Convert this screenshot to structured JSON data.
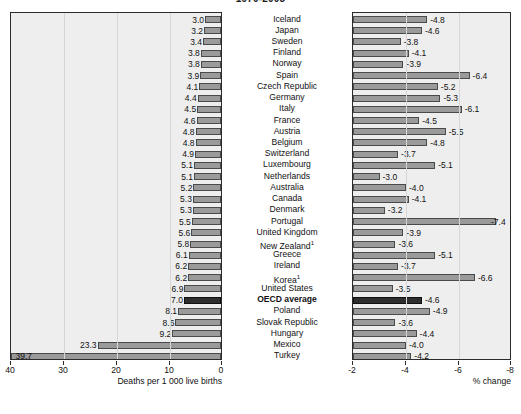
{
  "chart_data": {
    "type": "bar",
    "title": "1970-2005",
    "orientation": "horizontal",
    "panels": [
      {
        "id": "levels",
        "xlabel": "Deaths per 1 000 live births",
        "ticks": [
          40,
          30,
          20,
          10,
          0
        ],
        "xlim": [
          40,
          0
        ],
        "reversed": true,
        "grid": true
      },
      {
        "id": "change",
        "xlabel": "% change",
        "ticks": [
          -2,
          -4,
          -6,
          -8
        ],
        "xlim": [
          -2,
          -8
        ],
        "reversed": true,
        "grid": true
      }
    ],
    "categories": [
      "Iceland",
      "Japan",
      "Sweden",
      "Finland",
      "Norway",
      "Spain",
      "Czech Republic",
      "Germany",
      "Italy",
      "France",
      "Austria",
      "Belgium",
      "Switzerland",
      "Luxembourg",
      "Netherlands",
      "Australia",
      "Canada",
      "Denmark",
      "Portugal",
      "United Kingdom",
      "New Zealand¹",
      "Greece",
      "Ireland",
      "Korea¹",
      "United States",
      "OECD average",
      "Poland",
      "Slovak Republic",
      "Hungary",
      "Mexico",
      "Turkey"
    ],
    "series": [
      {
        "name": "Deaths per 1 000 live births",
        "panel": "levels",
        "values": [
          3.0,
          3.2,
          3.4,
          3.8,
          3.8,
          3.9,
          4.1,
          4.4,
          4.5,
          4.6,
          4.8,
          4.8,
          4.9,
          5.1,
          5.1,
          5.2,
          5.3,
          5.3,
          5.5,
          5.6,
          5.8,
          6.1,
          6.2,
          6.2,
          6.9,
          7.0,
          8.1,
          8.6,
          9.2,
          23.3,
          39.7
        ]
      },
      {
        "name": "% change",
        "panel": "change",
        "values": [
          -4.8,
          -4.6,
          -3.8,
          -4.1,
          -3.9,
          -6.4,
          -5.2,
          -5.3,
          -6.1,
          -4.5,
          -5.5,
          -4.8,
          -3.7,
          -5.1,
          -3.0,
          -4.0,
          -4.1,
          -3.2,
          -7.4,
          -3.9,
          -3.6,
          -5.1,
          -3.7,
          -6.6,
          -3.5,
          -4.6,
          -4.9,
          -3.6,
          -4.4,
          -4.0,
          -4.2
        ]
      }
    ],
    "highlight_category": "OECD average",
    "colors": {
      "bar": "#9a9a9a",
      "bar_border": "#4a4a4a",
      "bar_highlight": "#2e2e2e",
      "panel_background": "#eeeeee",
      "gridline": "#d6d6d6",
      "axis": "#2b2b2b",
      "text": "#111111"
    }
  }
}
